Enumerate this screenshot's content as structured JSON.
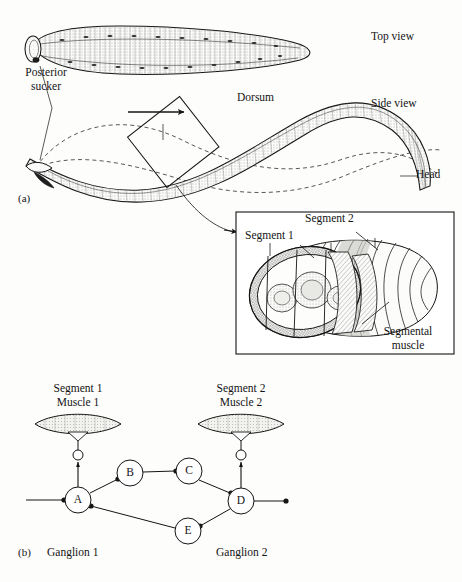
{
  "figure": {
    "background_color": "#fdfdfc",
    "ink_color": "#141414"
  },
  "panel_a": {
    "label": "(a)",
    "views": {
      "top_view": "Top view",
      "side_view": "Side view"
    },
    "annotations": {
      "posterior_sucker_line1": "Posterior",
      "posterior_sucker_line2": "sucker",
      "dorsum": "Dorsum",
      "head": "Head"
    },
    "swim_direction_arrow": "arrow pointing right"
  },
  "inset": {
    "annotations": {
      "segment_1": "Segment 1",
      "segment_2": "Segment 2",
      "segmental_muscle_line1": "Segmental",
      "segmental_muscle_line2": "muscle"
    }
  },
  "panel_b": {
    "label": "(b)",
    "headers": {
      "left_line1": "Segment 1",
      "left_line2": "Muscle 1",
      "right_line1": "Segment 2",
      "right_line2": "Muscle 2"
    },
    "ganglia": {
      "left": "Ganglion 1",
      "right": "Ganglion 2"
    },
    "nodes": [
      {
        "id": "A",
        "label": "A",
        "cx": 78,
        "cy": 500,
        "r": 13
      },
      {
        "id": "B",
        "label": "B",
        "cx": 130,
        "cy": 473,
        "r": 13
      },
      {
        "id": "C",
        "label": "C",
        "cx": 189,
        "cy": 471,
        "r": 13
      },
      {
        "id": "D",
        "label": "D",
        "cx": 241,
        "cy": 501,
        "r": 13
      },
      {
        "id": "E",
        "label": "E",
        "cx": 188,
        "cy": 531,
        "r": 13
      }
    ],
    "connections": [
      {
        "from": "input-left",
        "to": "A",
        "terminal": "dot"
      },
      {
        "from": "A",
        "to": "B",
        "terminal": "dot"
      },
      {
        "from": "B",
        "to": "C",
        "terminal": "dot"
      },
      {
        "from": "C",
        "to": "D",
        "terminal": "dot"
      },
      {
        "from": "A",
        "to": "E",
        "terminal": "dot"
      },
      {
        "from": "E",
        "to": "D",
        "terminal": "dot"
      },
      {
        "from": "D",
        "to": "A",
        "terminal": "dot"
      },
      {
        "from": "D",
        "to": "output-right",
        "terminal": "dot"
      },
      {
        "from": "A",
        "to": "synapse-1",
        "terminal": "arrow"
      },
      {
        "from": "D",
        "to": "synapse-2",
        "terminal": "arrow"
      }
    ],
    "synapse_markers": [
      {
        "id": "synapse-1",
        "cx": 78,
        "cy": 455,
        "r": 5
      },
      {
        "id": "synapse-2",
        "cx": 241,
        "cy": 455,
        "r": 5
      }
    ],
    "muscles": [
      {
        "id": "muscle-1",
        "cx": 78,
        "cy": 424
      },
      {
        "id": "muscle-2",
        "cx": 241,
        "cy": 424
      }
    ]
  }
}
